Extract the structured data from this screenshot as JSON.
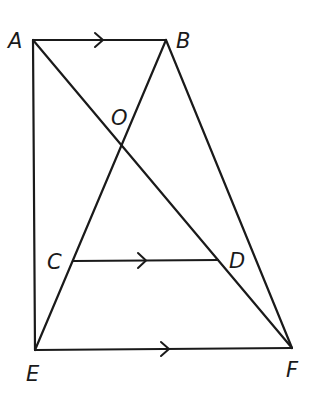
{
  "diagram": {
    "type": "geometry",
    "points": [
      {
        "id": "A",
        "label": "A",
        "x": 33,
        "y": 40,
        "lx": 8,
        "ly": 48
      },
      {
        "id": "B",
        "label": "B",
        "x": 166,
        "y": 40,
        "lx": 176,
        "ly": 48
      },
      {
        "id": "O",
        "label": "O",
        "x": 121,
        "y": 146,
        "lx": 111,
        "ly": 125
      },
      {
        "id": "C",
        "label": "C",
        "x": 73,
        "y": 261,
        "lx": 47,
        "ly": 269
      },
      {
        "id": "D",
        "label": "D",
        "x": 218,
        "y": 260,
        "lx": 229,
        "ly": 268
      },
      {
        "id": "E",
        "label": "E",
        "x": 35,
        "y": 350,
        "lx": 26,
        "ly": 381
      },
      {
        "id": "F",
        "label": "F",
        "x": 292,
        "y": 348,
        "lx": 286,
        "ly": 377
      }
    ],
    "segments": [
      {
        "from": "A",
        "to": "B",
        "parallel_mark": true
      },
      {
        "from": "A",
        "to": "E"
      },
      {
        "from": "A",
        "to": "F"
      },
      {
        "from": "B",
        "to": "E"
      },
      {
        "from": "B",
        "to": "F"
      },
      {
        "from": "C",
        "to": "D",
        "parallel_mark": true
      },
      {
        "from": "E",
        "to": "F",
        "parallel_mark": true
      }
    ],
    "annotations": [
      "AB ∥ CD ∥ EF (single-arrow parallel marks)",
      "O is the intersection of AF and BE"
    ]
  },
  "labels": {
    "A": "A",
    "B": "B",
    "O": "O",
    "C": "C",
    "D": "D",
    "E": "E",
    "F": "F"
  }
}
